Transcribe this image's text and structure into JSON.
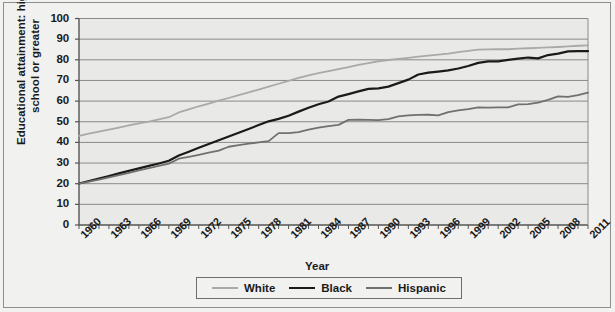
{
  "chart_data": {
    "type": "line",
    "title": "",
    "xlabel": "Year",
    "ylabel": "Educational attainment: high school or greater",
    "xlim": [
      1960,
      2011
    ],
    "ylim": [
      0,
      100
    ],
    "ytick_labels": [
      "0",
      "10",
      "20",
      "30",
      "40",
      "50",
      "60",
      "70",
      "80",
      "90",
      "100"
    ],
    "ytick_values": [
      0,
      10,
      20,
      30,
      40,
      50,
      60,
      70,
      80,
      90,
      100
    ],
    "xtick_labels": [
      "1960",
      "1963",
      "1966",
      "1969",
      "1972",
      "1975",
      "1978",
      "1981",
      "1984",
      "1987",
      "1990",
      "1993",
      "1996",
      "1999",
      "2002",
      "2005",
      "2008",
      "2011"
    ],
    "xtick_values": [
      1960,
      1963,
      1966,
      1969,
      1972,
      1975,
      1978,
      1981,
      1984,
      1987,
      1990,
      1993,
      1996,
      1999,
      2002,
      2005,
      2008,
      2011
    ],
    "grid": "horizontal",
    "legend_position": "bottom",
    "x": [
      1960,
      1961,
      1962,
      1963,
      1964,
      1965,
      1966,
      1967,
      1968,
      1969,
      1970,
      1971,
      1972,
      1973,
      1974,
      1975,
      1976,
      1977,
      1978,
      1979,
      1980,
      1981,
      1982,
      1983,
      1984,
      1985,
      1986,
      1987,
      1988,
      1989,
      1990,
      1991,
      1992,
      1993,
      1994,
      1995,
      1996,
      1997,
      1998,
      1999,
      2000,
      2001,
      2002,
      2003,
      2004,
      2005,
      2006,
      2007,
      2008,
      2009,
      2010,
      2011
    ],
    "series": [
      {
        "name": "White",
        "color": "#a9a9a9",
        "values": [
          43.2,
          44.2,
          45.2,
          46.2,
          47.2,
          48.2,
          49.2,
          50.1,
          51.1,
          52.2,
          54.5,
          56.0,
          57.5,
          58.8,
          60.2,
          61.5,
          62.9,
          64.2,
          65.6,
          67.0,
          68.4,
          69.8,
          71.2,
          72.5,
          73.5,
          74.5,
          75.5,
          76.5,
          77.5,
          78.4,
          79.3,
          79.9,
          80.4,
          80.9,
          81.5,
          82.0,
          82.5,
          83.0,
          83.7,
          84.3,
          84.9,
          85.0,
          85.2,
          85.1,
          85.4,
          85.6,
          85.8,
          86.0,
          86.2,
          86.5,
          86.8,
          87.0
        ]
      },
      {
        "name": "Black",
        "color": "#1a1a1a",
        "values": [
          20.1,
          21.3,
          22.5,
          23.7,
          25.0,
          26.2,
          27.4,
          28.6,
          29.8,
          31.1,
          33.7,
          35.5,
          37.4,
          39.2,
          41.0,
          42.9,
          44.7,
          46.5,
          48.4,
          50.2,
          51.4,
          52.9,
          54.9,
          56.8,
          58.5,
          59.8,
          62.2,
          63.4,
          64.7,
          65.9,
          66.2,
          67.0,
          68.7,
          70.4,
          72.9,
          73.8,
          74.3,
          74.9,
          75.8,
          77.0,
          78.5,
          79.2,
          79.2,
          80.0,
          80.6,
          81.1,
          80.7,
          82.3,
          83.0,
          84.1,
          84.2,
          84.2
        ]
      },
      {
        "name": "Hispanic",
        "color": "#707070",
        "values": [
          20.0,
          21.0,
          22.0,
          23.1,
          24.2,
          25.3,
          26.4,
          27.5,
          28.6,
          29.7,
          32.1,
          33.0,
          34.0,
          35.0,
          36.0,
          37.9,
          38.7,
          39.4,
          40.0,
          40.6,
          44.5,
          44.5,
          45.0,
          46.2,
          47.1,
          47.9,
          48.5,
          50.9,
          51.0,
          50.9,
          50.8,
          51.3,
          52.6,
          53.1,
          53.3,
          53.4,
          53.1,
          54.7,
          55.5,
          56.1,
          57.0,
          56.8,
          57.0,
          57.0,
          58.4,
          58.5,
          59.3,
          60.6,
          62.3,
          62.0,
          62.9,
          64.1
        ]
      }
    ]
  },
  "legend": {
    "items": [
      {
        "label": "White",
        "color": "#a9a9a9"
      },
      {
        "label": "Black",
        "color": "#1a1a1a"
      },
      {
        "label": "Hispanic",
        "color": "#707070"
      }
    ]
  }
}
